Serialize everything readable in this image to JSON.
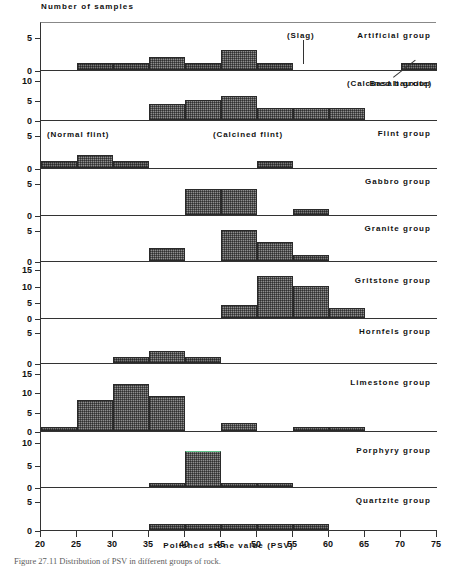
{
  "axis_title_y": "Number of samples",
  "axis_title_x": "Polished stone value (PSV)",
  "caption": "Figure 27.11  Distribution of PSV in different groups of rock.",
  "chart_data": {
    "type": "bar",
    "title": "Distribution of PSV in different groups of rock",
    "xlabel": "Polished stone value (PSV)",
    "ylabel": "Number of samples",
    "xlim": [
      20,
      75
    ],
    "xtick_labels": [
      "20",
      "25",
      "30",
      "35",
      "40",
      "45",
      "50",
      "55",
      "60",
      "65",
      "70",
      "75"
    ],
    "xticks": [
      20,
      25,
      30,
      35,
      40,
      45,
      50,
      55,
      60,
      65,
      70,
      75
    ],
    "bin_width": 5,
    "grid": false,
    "legend": "none",
    "panels": [
      {
        "name": "Artificial group",
        "label": "Artificial group",
        "ylim": [
          0,
          7
        ],
        "yticks": [
          0,
          5
        ],
        "ytick_labels": [
          "0",
          "5"
        ],
        "bins": [
          25,
          30,
          35,
          40,
          45,
          50,
          70
        ],
        "values": [
          1,
          1,
          2,
          1,
          3,
          1,
          1
        ],
        "annotations": [
          {
            "text": "(Slag)",
            "target_bin": 50
          },
          {
            "text": "(Calcined bauxite)",
            "target_bin": 70
          }
        ]
      },
      {
        "name": "Basalt group",
        "label": "Basalt group",
        "ylim": [
          0,
          12
        ],
        "yticks": [
          0,
          5,
          10
        ],
        "ytick_labels": [
          "0",
          "5",
          "10"
        ],
        "bins": [
          35,
          40,
          45,
          50,
          55,
          60
        ],
        "values": [
          4,
          5,
          6,
          3,
          3,
          3
        ],
        "annotations": []
      },
      {
        "name": "Flint group",
        "label": "Flint group",
        "ylim": [
          0,
          7
        ],
        "yticks": [
          0,
          5
        ],
        "ytick_labels": [
          "0",
          "5"
        ],
        "bins": [
          20,
          25,
          30,
          50
        ],
        "values": [
          1,
          2,
          1,
          1
        ],
        "annotations": [
          {
            "text": "(Normal flint)",
            "target_bin": 25
          },
          {
            "text": "(Calcined flint)",
            "target_bin": 50
          }
        ]
      },
      {
        "name": "Gabbro group",
        "label": "Gabbro group",
        "ylim": [
          0,
          7
        ],
        "yticks": [
          0,
          5
        ],
        "ytick_labels": [
          "0",
          "5"
        ],
        "bins": [
          40,
          45,
          55
        ],
        "values": [
          4,
          4,
          1
        ],
        "annotations": []
      },
      {
        "name": "Granite group",
        "label": "Granite group",
        "ylim": [
          0,
          7
        ],
        "yticks": [
          0,
          5
        ],
        "ytick_labels": [
          "0",
          "5"
        ],
        "bins": [
          35,
          45,
          50,
          55
        ],
        "values": [
          2,
          5,
          3,
          1
        ],
        "annotations": []
      },
      {
        "name": "Gritstone group",
        "label": "Gritstone group",
        "ylim": [
          0,
          17
        ],
        "yticks": [
          0,
          5,
          10,
          15
        ],
        "ytick_labels": [
          "0",
          "5",
          "10",
          "15"
        ],
        "bins": [
          45,
          50,
          55,
          60
        ],
        "values": [
          4,
          13,
          10,
          3
        ],
        "annotations": []
      },
      {
        "name": "Hornfels group",
        "label": "Hornfels group",
        "ylim": [
          0,
          7
        ],
        "yticks": [
          0,
          5
        ],
        "ytick_labels": [
          "0",
          "5"
        ],
        "bins": [
          30,
          35,
          40
        ],
        "values": [
          1,
          2,
          1
        ],
        "annotations": []
      },
      {
        "name": "Limestone group",
        "label": "Limestone group",
        "ylim": [
          0,
          17
        ],
        "yticks": [
          0,
          5,
          10,
          15
        ],
        "ytick_labels": [
          "0",
          "5",
          "10",
          "15"
        ],
        "bins": [
          20,
          25,
          30,
          35,
          45,
          55,
          60
        ],
        "values": [
          1,
          8,
          12,
          9,
          2,
          1,
          1
        ],
        "annotations": []
      },
      {
        "name": "Porphyry group",
        "label": "Porphyry group",
        "ylim": [
          0,
          12
        ],
        "yticks": [
          0,
          5,
          10
        ],
        "ytick_labels": [
          "0",
          "5",
          "10"
        ],
        "bins": [
          35,
          40,
          45,
          50
        ],
        "values": [
          1,
          8,
          1,
          1
        ],
        "highlight_bin": 40,
        "annotations": []
      },
      {
        "name": "Quartzite group",
        "label": "Quartzite group",
        "ylim": [
          0,
          7
        ],
        "yticks": [
          0,
          5
        ],
        "ytick_labels": [
          "0",
          "5"
        ],
        "bins": [
          35,
          40,
          45,
          50,
          55
        ],
        "values": [
          1,
          1,
          1,
          1,
          1
        ],
        "annotations": []
      }
    ]
  }
}
